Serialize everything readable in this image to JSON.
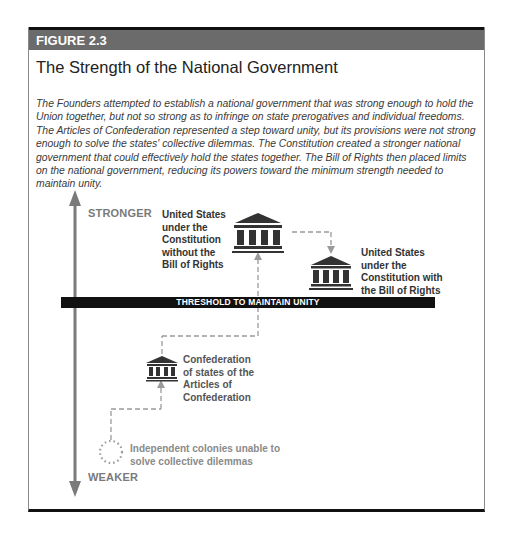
{
  "figure": {
    "number": "FIGURE 2.3",
    "title": "The Strength of the National Government",
    "caption": "The Founders attempted to establish a national government that was strong enough to hold the Union together, but not so strong as to infringe on state prerogatives and individual freedoms. The Articles of Confederation represented a step toward unity, but its provisions were not strong enough to solve the states' collective dilemmas. The Constitution created a stronger national government that could effectively hold the states together. The Bill of Rights then placed limits on the national government, reducing its powers toward the minimum strength needed to maintain unity."
  },
  "axis": {
    "top_label": "STRONGER",
    "bottom_label": "WEAKER"
  },
  "threshold": {
    "label": "THRESHOLD TO MAINTAIN UNITY"
  },
  "stages": [
    {
      "id": "colonies",
      "label": "Independent colonies unable to solve collective dilemmas",
      "icon": "dotted-circle-icon"
    },
    {
      "id": "confederation",
      "label": "Confederation of states of the Articles of Confederation",
      "icon": "government-building-icon"
    },
    {
      "id": "constitution-no-bor",
      "label": "United States under the Constitution without the Bill of Rights",
      "icon": "government-building-icon"
    },
    {
      "id": "constitution-bor",
      "label": "United States under the Constitution with the Bill of Rights",
      "icon": "government-building-icon"
    }
  ],
  "labels": {
    "colonies_line1": "Independent colonies unable to",
    "colonies_line2": "solve collective dilemmas",
    "confed_line1": "Confederation",
    "confed_line2": "of states of the",
    "confed_line3": "Articles of",
    "confed_line4": "Confederation",
    "const1_line1": "United States",
    "const1_line2": "under the",
    "const1_line3": "Constitution",
    "const1_line4": "without the",
    "const1_line5": "Bill of Rights",
    "const2_line1": "United States",
    "const2_line2": "under the",
    "const2_line3": "Constitution with",
    "const2_line4": "the Bill of Rights"
  },
  "colors": {
    "header_bg": "#6b6b6b",
    "threshold_bg": "#111111",
    "axis": "#7a7a7a",
    "icon": "#333333",
    "dashed_path": "#9a9a9a"
  }
}
